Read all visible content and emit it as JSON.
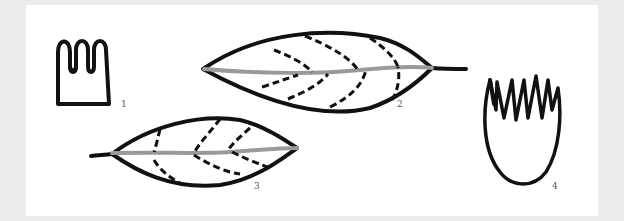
{
  "figure": {
    "colors": {
      "background": "#ececec",
      "panel": "#ffffff",
      "outline": "#111111",
      "midrib": "#9a9a9a",
      "label": "#555555"
    },
    "items": [
      {
        "id": 1,
        "label": "1",
        "shape": "square-based outline with four rounded lobes at top"
      },
      {
        "id": 2,
        "label": "2",
        "shape": "elliptic leaf with stem on right, dashed secondary veins, gray midrib"
      },
      {
        "id": 3,
        "label": "3",
        "shape": "elliptic leaf with stem on left, dashed secondary veins, gray midrib"
      },
      {
        "id": 4,
        "label": "4",
        "shape": "U-shaped outline with five pointed lobes at top"
      }
    ]
  }
}
